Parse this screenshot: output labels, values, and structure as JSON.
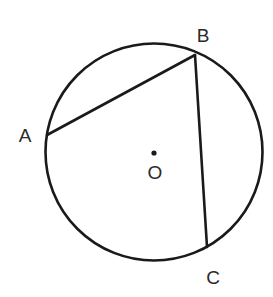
{
  "diagram": {
    "circle": {
      "center": {
        "x": 154,
        "y": 152
      },
      "r": 108.5,
      "center_label": "O"
    },
    "points": [
      {
        "id": "A",
        "label": "A",
        "x": 47,
        "y": 135,
        "label_x": 25,
        "label_y": 142
      },
      {
        "id": "B",
        "label": "B",
        "x": 195,
        "y": 55,
        "label_x": 203,
        "label_y": 42
      },
      {
        "id": "C",
        "label": "C",
        "x": 207,
        "y": 247,
        "label_x": 213,
        "label_y": 284
      }
    ],
    "segments": [
      {
        "name": "chord-ab",
        "from": "A",
        "to": "B"
      },
      {
        "name": "chord-bc",
        "from": "B",
        "to": "C"
      }
    ],
    "center_dot": {
      "x": 154,
      "y": 153,
      "r": 2.6
    },
    "center_label_pos": {
      "x": 155,
      "y": 179
    },
    "colors": {
      "stroke": "#1a1a1a",
      "text": "#2a2a2a",
      "background": "#ffffff"
    }
  }
}
